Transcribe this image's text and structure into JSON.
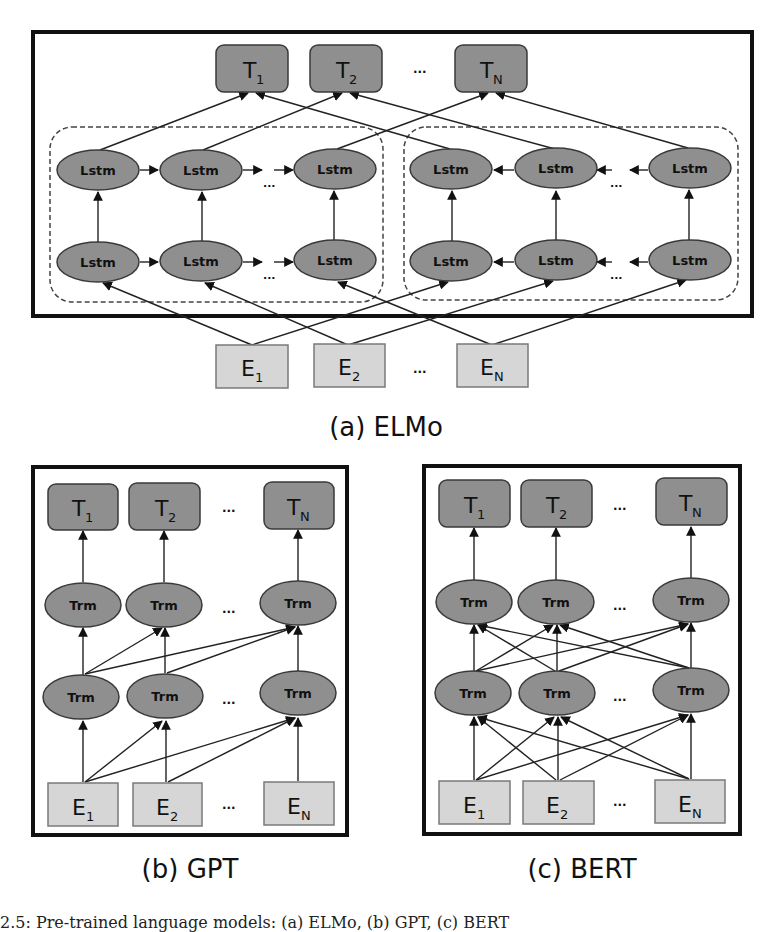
{
  "figure": {
    "panels": [
      {
        "id": "elmo",
        "caption": "(a) ELMo",
        "outputs": [
          "T",
          "T",
          "T"
        ],
        "output_subs": [
          "1",
          "2",
          "N"
        ],
        "inputs": [
          "E",
          "E",
          "E"
        ],
        "input_subs": [
          "1",
          "2",
          "N"
        ],
        "node_label": "Lstm",
        "ellipsis": "..."
      },
      {
        "id": "gpt",
        "caption": "(b) GPT",
        "outputs": [
          "T",
          "T",
          "T"
        ],
        "output_subs": [
          "1",
          "2",
          "N"
        ],
        "inputs": [
          "E",
          "E",
          "E"
        ],
        "input_subs": [
          "1",
          "2",
          "N"
        ],
        "node_label": "Trm",
        "ellipsis": "..."
      },
      {
        "id": "bert",
        "caption": "(c) BERT",
        "outputs": [
          "T",
          "T",
          "T"
        ],
        "output_subs": [
          "1",
          "2",
          "N"
        ],
        "inputs": [
          "E",
          "E",
          "E"
        ],
        "input_subs": [
          "1",
          "2",
          "N"
        ],
        "node_label": "Trm",
        "ellipsis": "..."
      }
    ],
    "bottom_caption": "2.5: Pre-trained language models: (a) ELMo, (b) GPT, (c) BERT"
  },
  "colors": {
    "node_fill": "#8f8f8f",
    "input_fill": "#d6d6d6",
    "frame": "#111111"
  }
}
